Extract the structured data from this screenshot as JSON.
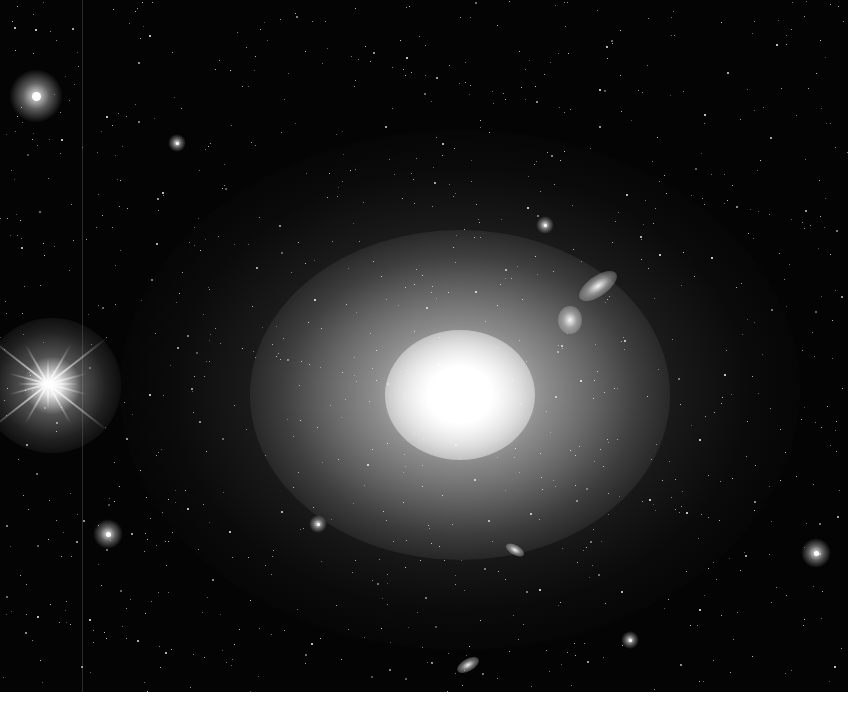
{
  "image": {
    "subject": "giant elliptical galaxy in a dense star field",
    "colors": {
      "sky": "#040404",
      "core": "#ffffff",
      "band": "#ffffff"
    },
    "galaxy": {
      "center": [
        460,
        395
      ]
    },
    "bright_star": {
      "center": [
        48,
        384
      ],
      "spikes": 8
    },
    "stars": [
      [
        36,
        96,
        9
      ],
      [
        177,
        143,
        3
      ],
      [
        108,
        534,
        5
      ],
      [
        816,
        553,
        5
      ],
      [
        318,
        524,
        3
      ],
      [
        528,
        208,
        2
      ],
      [
        545,
        225,
        3
      ],
      [
        712,
        258,
        2
      ],
      [
        660,
        255,
        2
      ],
      [
        315,
        300,
        2
      ],
      [
        150,
        395,
        2
      ],
      [
        725,
        375,
        2
      ],
      [
        630,
        640,
        3
      ],
      [
        312,
        644,
        2
      ],
      [
        540,
        590,
        2
      ],
      [
        62,
        140,
        2
      ],
      [
        230,
        70,
        1
      ],
      [
        400,
        40,
        1
      ],
      [
        600,
        90,
        2
      ],
      [
        760,
        160,
        1
      ],
      [
        820,
        40,
        1
      ],
      [
        90,
        620,
        2
      ],
      [
        40,
        660,
        1
      ],
      [
        700,
        610,
        2
      ],
      [
        780,
        480,
        1
      ],
      [
        250,
        600,
        1
      ],
      [
        480,
        620,
        1
      ],
      [
        650,
        500,
        2
      ],
      [
        200,
        250,
        1
      ],
      [
        350,
        170,
        1
      ],
      [
        560,
        160,
        1
      ],
      [
        700,
        440,
        2
      ],
      [
        140,
        470,
        1
      ],
      [
        20,
        220,
        1
      ],
      [
        120,
        180,
        1
      ],
      [
        480,
        120,
        1
      ],
      [
        620,
        30,
        1
      ],
      [
        300,
        420,
        1
      ],
      [
        570,
        450,
        1
      ],
      [
        420,
        560,
        1
      ]
    ],
    "small_galaxies": [
      [
        598,
        286,
        22,
        10,
        -35
      ],
      [
        570,
        320,
        12,
        14,
        0
      ],
      [
        515,
        550,
        10,
        5,
        30
      ],
      [
        468,
        665,
        12,
        6,
        -30
      ]
    ]
  }
}
